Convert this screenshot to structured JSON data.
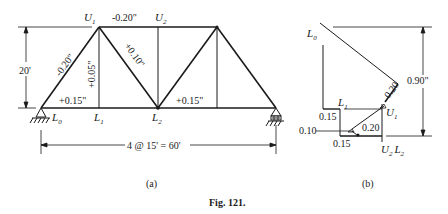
{
  "figure": {
    "caption": "Fig. 121.",
    "panel_a_label": "(a)",
    "panel_b_label": "(b)"
  },
  "truss": {
    "nodes": {
      "U1": "U",
      "U1_sub": "1",
      "U2": "U",
      "U2_sub": "2",
      "L0": "L",
      "L0_sub": "0",
      "L1": "L",
      "L1_sub": "1",
      "L2": "L",
      "L2_sub": "2"
    },
    "member_changes": {
      "L0U1": "-0.20\"",
      "U1U2": "-0.20\"",
      "U1L1": "+0.05\"",
      "U1L2": "+0.10\"",
      "L0L1": "+0.15\"",
      "L2L3": "+0.15\""
    },
    "height_dimension": "20'",
    "span_dimension": "4 @ 15' = 60'"
  },
  "williot": {
    "labels": {
      "L0": "L",
      "L0_sub": "0",
      "L1": "L",
      "L1_sub": "1",
      "U1": "U",
      "U1_sub": "1",
      "U2L2_a": "U",
      "U2L2_a_sub": "2",
      "U2L2_b": "L",
      "U2L2_b_sub": "2"
    },
    "values": {
      "upper_diag": "0.20",
      "left_horiz": "0.15",
      "left_vert": "0.10",
      "lower_horiz": "0.15",
      "lower_diag": "0.20",
      "total_deflection": "0.90\""
    }
  }
}
